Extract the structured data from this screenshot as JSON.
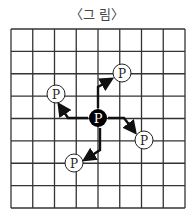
{
  "title": "〈그  림〉",
  "grid": {
    "cols": 8,
    "rows": 8,
    "left": 11,
    "top": 29,
    "right": 185,
    "bottom": 208,
    "line_color": "#333333"
  },
  "center_particle": {
    "label": "P",
    "x": 98,
    "y": 118,
    "fill": "#000000",
    "text_color": "#ffffff"
  },
  "particles": [
    {
      "label": "P",
      "x": 122,
      "y": 73
    },
    {
      "label": "P",
      "x": 56,
      "y": 94
    },
    {
      "label": "P",
      "x": 144,
      "y": 140
    },
    {
      "label": "P",
      "x": 74,
      "y": 163
    }
  ]
}
